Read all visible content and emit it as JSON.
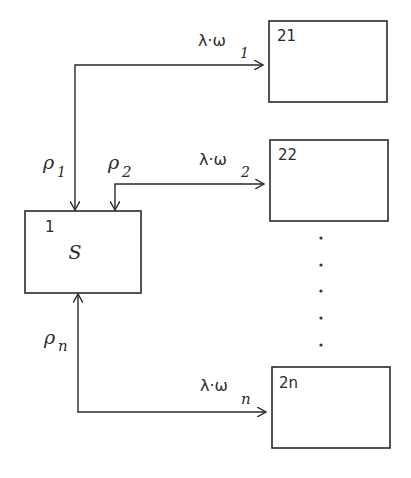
{
  "diagram": {
    "type": "flow-diagram",
    "nodes": [
      {
        "id": "1",
        "number": "1",
        "label": "S"
      },
      {
        "id": "21",
        "number": "21",
        "label": ""
      },
      {
        "id": "22",
        "number": "22",
        "label": ""
      },
      {
        "id": "2n",
        "number": "2n",
        "label": ""
      }
    ],
    "edges": [
      {
        "from": "1",
        "to": "21",
        "source_label": "ρ",
        "source_sub": "1",
        "target_label": "λ·ω",
        "target_sub": "1"
      },
      {
        "from": "1",
        "to": "22",
        "source_label": "ρ",
        "source_sub": "2",
        "target_label": "λ·ω",
        "target_sub": "2"
      },
      {
        "from": "1",
        "to": "2n",
        "source_label": "ρ",
        "source_sub": "n",
        "target_label": "λ·ω",
        "target_sub": "n"
      }
    ],
    "ellipsis": "vertical dots between node 22 and node 2n",
    "colors": {
      "stroke": "#2a2a2a",
      "background": "#ffffff"
    }
  }
}
